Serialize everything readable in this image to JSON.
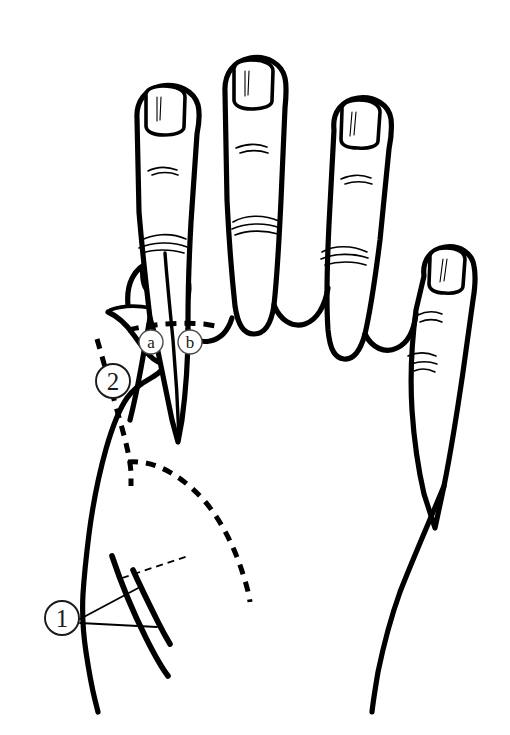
{
  "figure": {
    "background_color": "#ffffff",
    "ink_color": "#000000",
    "width": 510,
    "height": 735
  },
  "annotations": {
    "items": [
      {
        "id": "marker-1",
        "label": "1",
        "style": "circled-numeral",
        "glyph": "①",
        "cx": 62,
        "cy": 618,
        "r": 17,
        "description": "circled numeral one at lower left with two leader lines"
      },
      {
        "id": "marker-2",
        "label": "2",
        "style": "circled-numeral",
        "glyph": "②",
        "cx": 113,
        "cy": 381,
        "r": 17,
        "description": "circled numeral two beside thumb dashed incision"
      },
      {
        "id": "marker-a",
        "label": "a",
        "style": "circled-letter",
        "glyph": "ⓐ",
        "cx": 151,
        "cy": 342,
        "r": 12,
        "description": "circled letter a below index web dashed line"
      },
      {
        "id": "marker-b",
        "label": "b",
        "style": "circled-letter",
        "glyph": "ⓑ",
        "cx": 190,
        "cy": 342,
        "r": 12,
        "description": "circled letter b below index web dashed line"
      }
    ]
  },
  "anatomy": {
    "view": "dorsal view of left hand",
    "digits": [
      {
        "name": "thumb",
        "has_nail": true
      },
      {
        "name": "index-finger",
        "has_nail": true
      },
      {
        "name": "middle-finger",
        "has_nail": true
      },
      {
        "name": "ring-finger",
        "has_nail": true
      },
      {
        "name": "little-finger",
        "has_nail": true
      }
    ]
  },
  "incision_lines": {
    "items": [
      {
        "id": "solid-index-longitudinal",
        "style": "solid",
        "description": "solid longitudinal line down index finger into web space"
      },
      {
        "id": "dashed-web-transverse",
        "style": "dashed-bold",
        "description": "bold dashed transverse line across index web base"
      },
      {
        "id": "dashed-thumb-longitudinal",
        "style": "dashed-bold",
        "description": "bold dashed line along thumb to palm"
      },
      {
        "id": "dashed-palm-curve",
        "style": "dashed-bold",
        "description": "bold dashed curve sweeping across palm"
      },
      {
        "id": "leader-thin-dashed",
        "style": "dashed-thin",
        "description": "thin dashed leader line near wrist"
      },
      {
        "id": "leader-1-upper",
        "style": "solid-thin",
        "description": "thin leader from marker 1 to upper structure"
      },
      {
        "id": "leader-1-lower",
        "style": "solid-thin",
        "description": "thin leader from marker 1 to lower structure"
      }
    ]
  }
}
